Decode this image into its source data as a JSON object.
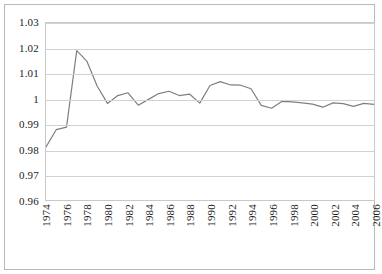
{
  "chart_data": {
    "type": "line",
    "title": "",
    "subtitle": "",
    "xlabel": "",
    "ylabel": "",
    "ylim": [
      0.96,
      1.03
    ],
    "xlim": [
      1974,
      2006
    ],
    "grid": true,
    "legend": false,
    "legend_position": "none",
    "y_ticks": [
      "1.03",
      "1.02",
      "1.01",
      "1",
      "0.99",
      "0.98",
      "0.97",
      "0.96"
    ],
    "y_tick_values": [
      1.03,
      1.02,
      1.01,
      1.0,
      0.99,
      0.98,
      0.97,
      0.96
    ],
    "x_tick_labels": [
      "1974",
      "1976",
      "1978",
      "1980",
      "1982",
      "1984",
      "1986",
      "1988",
      "1990",
      "1992",
      "1994",
      "1996",
      "1998",
      "2000",
      "2002",
      "2004",
      "2006"
    ],
    "x_tick_values": [
      1974,
      1976,
      1978,
      1980,
      1982,
      1984,
      1986,
      1988,
      1990,
      1992,
      1994,
      1996,
      1998,
      2000,
      2002,
      2004,
      2006
    ],
    "line_color": "#7f7f7f",
    "x": [
      1974,
      1975,
      1976,
      1977,
      1978,
      1979,
      1980,
      1981,
      1982,
      1983,
      1984,
      1985,
      1986,
      1987,
      1988,
      1989,
      1990,
      1991,
      1992,
      1993,
      1994,
      1995,
      1996,
      1997,
      1998,
      1999,
      2000,
      2001,
      2002,
      2003,
      2004,
      2005,
      2006
    ],
    "values": [
      0.981,
      0.9878,
      0.9888,
      1.0191,
      1.0148,
      1.005,
      0.9982,
      1.0013,
      1.0024,
      0.9975,
      0.9998,
      1.0021,
      1.003,
      1.0013,
      1.0019,
      0.9983,
      1.0053,
      1.0068,
      1.0055,
      1.0054,
      1.004,
      0.9974,
      0.9963,
      0.999,
      0.9988,
      0.9984,
      0.9979,
      0.9967,
      0.9984,
      0.9981,
      0.997,
      0.9982,
      0.9978
    ]
  }
}
